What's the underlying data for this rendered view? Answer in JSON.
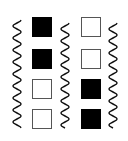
{
  "diagram": {
    "colors": {
      "filled": "#000000",
      "empty": "#ffffff",
      "stroke": "#555555",
      "wave": "#111111"
    },
    "waves": [
      {
        "id": "left",
        "x": 12,
        "y_top": 20,
        "y_bottom": 128
      },
      {
        "id": "middle",
        "x": 60,
        "y_top": 23,
        "y_bottom": 128
      },
      {
        "id": "right",
        "x": 108,
        "y_top": 23,
        "y_bottom": 128
      }
    ],
    "columns": [
      {
        "x": 32,
        "cells": [
          {
            "state": "filled"
          },
          {
            "state": "filled"
          },
          {
            "state": "empty"
          },
          {
            "state": "empty"
          }
        ]
      },
      {
        "x": 81,
        "cells": [
          {
            "state": "empty"
          },
          {
            "state": "empty"
          },
          {
            "state": "filled"
          },
          {
            "state": "filled"
          }
        ]
      }
    ],
    "row_y": [
      17,
      49,
      79,
      109
    ]
  }
}
